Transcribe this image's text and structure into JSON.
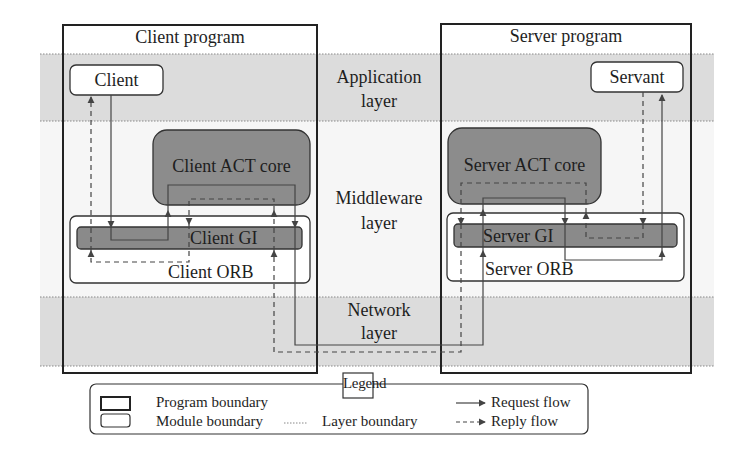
{
  "diagram": {
    "programs": {
      "client": {
        "title": "Client program"
      },
      "server": {
        "title": "Server program"
      }
    },
    "layers": [
      {
        "name": "application",
        "line1": "Application",
        "line2": "layer"
      },
      {
        "name": "middleware",
        "line1": "Middleware",
        "line2": "layer"
      },
      {
        "name": "network",
        "line1": "Network",
        "line2": "layer"
      }
    ],
    "modules": {
      "client": "Client",
      "client_act_core": "Client ACT core",
      "client_gi": "Client GI",
      "client_orb": "Client ORB",
      "servant": "Servant",
      "server_act_core": "Server ACT core",
      "server_gi": "Server GI",
      "server_orb": "Server ORB"
    },
    "colors": {
      "layer_band": "#dcdcdc",
      "core_fill": "#8c8c8c",
      "gi_fill": "#8a8a8a",
      "stroke": "#2a2a2a",
      "flow_line": "#444444"
    }
  },
  "legend": {
    "title": "Legend",
    "items": {
      "program_boundary": "Program boundary",
      "module_boundary": "Module boundary",
      "layer_boundary": "Layer boundary",
      "request_flow": "Request flow",
      "reply_flow": "Reply flow"
    }
  }
}
